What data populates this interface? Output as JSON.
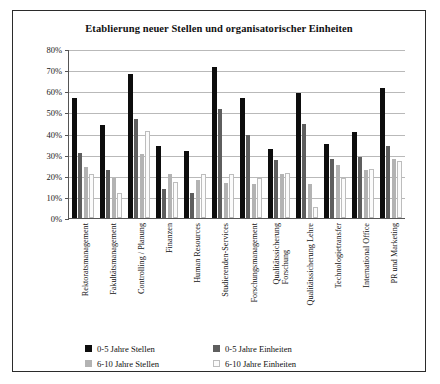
{
  "chart_data": {
    "type": "bar",
    "title": "Etablierung neuer Stellen und organisatorischer Einheiten",
    "xlabel": "",
    "ylabel": "",
    "ylim": [
      0,
      80
    ],
    "ytick_labels": [
      "80%",
      "70%",
      "60%",
      "50%",
      "40%",
      "30%",
      "20%",
      "10%",
      "0%"
    ],
    "ytick_values": [
      80,
      70,
      60,
      50,
      40,
      30,
      20,
      10,
      0
    ],
    "grid": true,
    "legend_position": "bottom",
    "categories": [
      "Rektoratsmanagement",
      "Fakultätsmanagement",
      "Controlling / Planung",
      "Finanzen",
      "Human Resources",
      "Studierenden-Services",
      "Forschungsmanagement",
      "Qualitätssicherung\nForschung",
      "Qualitätssicherung Lehre",
      "Technologietransfer",
      "International Office",
      "PR und Marketing"
    ],
    "series": [
      {
        "name": "0-5 Jahre Stellen",
        "color": "#0d0d0d",
        "values": [
          57,
          44,
          68,
          34,
          31.5,
          71.5,
          57,
          32.5,
          59,
          35,
          40.5,
          61.5
        ]
      },
      {
        "name": "0-5 Jahre Einheiten",
        "color": "#5e5e5e",
        "values": [
          31,
          22.5,
          47,
          13.5,
          12,
          51.5,
          39.5,
          27.5,
          44.5,
          28,
          29,
          34
        ]
      },
      {
        "name": "6-10 Jahre Stellen",
        "color": "#b3b3b3",
        "values": [
          24,
          19,
          30.5,
          21,
          18,
          16.5,
          16,
          21,
          16,
          25,
          22.5,
          28
        ]
      },
      {
        "name": "6-10 Jahre Einheiten",
        "color": "#fbfbfb",
        "values": [
          21,
          12,
          41,
          17,
          21,
          21,
          19,
          21.5,
          5,
          19,
          23,
          27
        ]
      }
    ]
  }
}
